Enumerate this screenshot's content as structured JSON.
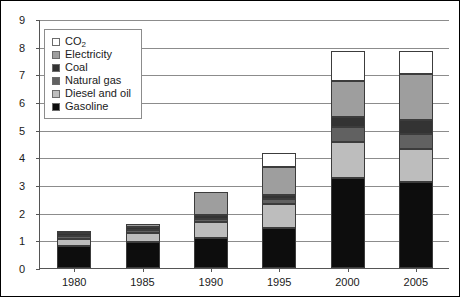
{
  "chart_data": {
    "type": "bar",
    "stacked": true,
    "title": "",
    "subtitle": "",
    "xlabel": "",
    "ylabel": "",
    "categories": [
      "1980",
      "1985",
      "1990",
      "1995",
      "2000",
      "2005"
    ],
    "ylim": [
      0,
      9
    ],
    "yticks": [
      0,
      1,
      2,
      3,
      4,
      5,
      6,
      7,
      8,
      9
    ],
    "ytick_labels": [
      "0",
      "1",
      "2",
      "3",
      "4",
      "5",
      "6",
      "7",
      "8",
      "9"
    ],
    "grid": true,
    "legend_position": "top-left",
    "series": [
      {
        "name": "Gasoline",
        "color": "#0d0d0d",
        "values": [
          0.78,
          0.95,
          1.1,
          1.45,
          3.25,
          3.1
        ]
      },
      {
        "name": "Diesel and oil",
        "color": "#bdbdbd",
        "values": [
          0.27,
          0.3,
          0.55,
          0.85,
          1.3,
          1.2
        ]
      },
      {
        "name": "Natural gas",
        "color": "#616161",
        "values": [
          0.12,
          0.13,
          0.13,
          0.2,
          0.55,
          0.55
        ]
      },
      {
        "name": "Coal",
        "color": "#333333",
        "values": [
          0.1,
          0.1,
          0.12,
          0.15,
          0.35,
          0.5
        ]
      },
      {
        "name": "Electricity",
        "color": "#9e9e9e",
        "values": [
          0.03,
          0.12,
          0.85,
          1.0,
          1.3,
          1.65
        ]
      },
      {
        "name": "CO2",
        "color": "#ffffff",
        "values": [
          0.0,
          0.0,
          0.0,
          0.5,
          1.1,
          0.85
        ]
      }
    ],
    "totals": [
      1.3,
      1.6,
      2.75,
      4.15,
      7.85,
      7.85
    ],
    "legend_entries": [
      {
        "label": "CO",
        "subscript": "2",
        "color": "#ffffff"
      },
      {
        "label": "Electricity",
        "subscript": "",
        "color": "#9e9e9e"
      },
      {
        "label": "Coal",
        "subscript": "",
        "color": "#333333"
      },
      {
        "label": "Natural gas",
        "subscript": "",
        "color": "#616161"
      },
      {
        "label": "Diesel and oil",
        "subscript": "",
        "color": "#bdbdbd"
      },
      {
        "label": "Gasoline",
        "subscript": "",
        "color": "#0d0d0d"
      }
    ]
  },
  "colors": {
    "axis": "#555555",
    "grid": "#8c8c8c",
    "frame": "#000000",
    "bar_outline": "#3c3c3c",
    "text": "#1a1a1a"
  }
}
